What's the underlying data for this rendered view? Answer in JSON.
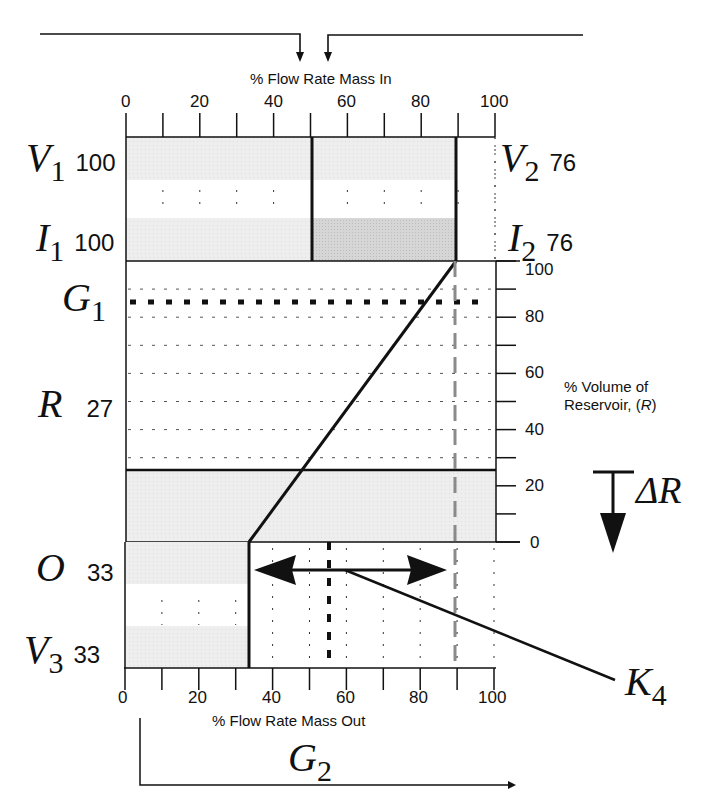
{
  "chart_data": {
    "type": "diagram",
    "title": "",
    "top_axis": {
      "label": "% Flow Rate Mass In",
      "ticks": [
        "0",
        "20",
        "40",
        "60",
        "80",
        "100"
      ],
      "range": [
        0,
        100
      ]
    },
    "bottom_axis": {
      "label": "% Flow Rate Mass Out",
      "ticks": [
        "0",
        "20",
        "40",
        "60",
        "80",
        "100"
      ],
      "range": [
        0,
        100
      ]
    },
    "right_axis": {
      "label_line1": "% Volume of",
      "label_line2": "Reservoir, (",
      "label_var": "R",
      "label_end": ")",
      "ticks": [
        "0",
        "20",
        "40",
        "60",
        "80",
        "100"
      ],
      "range": [
        0,
        100
      ]
    },
    "inputs": [
      {
        "symbol": "V",
        "sub": "1",
        "value": "100",
        "start": 0,
        "end": 50
      },
      {
        "symbol": "I",
        "sub": "1",
        "value": "100",
        "start": 0,
        "end": 50
      },
      {
        "symbol": "V",
        "sub": "2",
        "value": "76",
        "start": 50,
        "end": 89
      },
      {
        "symbol": "I",
        "sub": "2",
        "value": "76",
        "start": 50,
        "end": 89
      }
    ],
    "reservoir": {
      "symbol": "R",
      "value": "27",
      "level": 27
    },
    "g1": {
      "symbol": "G",
      "sub": "1",
      "level": 86
    },
    "outputs": [
      {
        "symbol": "O",
        "value": "33",
        "end": 33
      },
      {
        "symbol": "V",
        "sub": "3",
        "value": "33",
        "end": 33
      }
    ],
    "delta": {
      "symbol": "ΔR"
    },
    "k4": {
      "symbol": "K",
      "sub": "4"
    },
    "g2": {
      "symbol": "G",
      "sub": "2"
    },
    "markers": {
      "inflow_total": 89,
      "outflow_dashed": 55,
      "double_arrow_from": 33,
      "double_arrow_to": 88
    },
    "colors": {
      "ink": "#111111",
      "band_light": "#ececec",
      "band_dark": "#d4d4d4",
      "grey_dash": "#8a8a8a"
    }
  }
}
